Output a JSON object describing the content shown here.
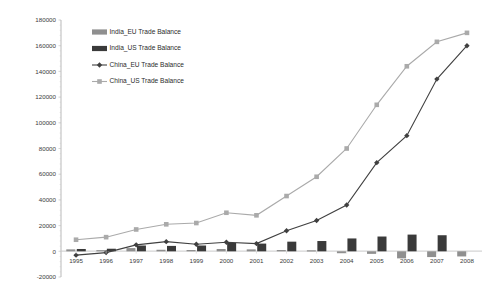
{
  "chart_data": {
    "type": "bar",
    "title": "",
    "xlabel": "",
    "ylabel": "",
    "grid": false,
    "legend_position": "top-left-inside",
    "categories": [
      "1995",
      "1996",
      "1997",
      "1998",
      "1999",
      "2000",
      "2001",
      "2002",
      "2003",
      "2004",
      "2005",
      "2006",
      "2007",
      "2008"
    ],
    "ylim": [
      -20000,
      180000
    ],
    "ytick_labels": [
      "180000",
      "160000",
      "140000",
      "120000",
      "100000",
      "80000",
      "60000",
      "40000",
      "20000",
      "0",
      "-20000"
    ],
    "ytick_values": [
      180000,
      160000,
      140000,
      120000,
      100000,
      80000,
      60000,
      40000,
      20000,
      0,
      -20000
    ],
    "series": [
      {
        "name": "India_EU Trade Balance",
        "kind": "bar",
        "color": "#8f8f8f",
        "values": [
          1500,
          900,
          2500,
          1200,
          1000,
          1800,
          1500,
          1000,
          800,
          -1500,
          -2000,
          -5500,
          -4500,
          -4000
        ]
      },
      {
        "name": "India_US Trade Balance",
        "kind": "bar",
        "color": "#3a3a3a",
        "values": [
          1800,
          2000,
          4500,
          4200,
          4500,
          6500,
          6000,
          7500,
          8000,
          10000,
          11500,
          13000,
          12500,
          0
        ]
      },
      {
        "name": "China_EU Trade Balance",
        "kind": "line",
        "color": "#404040",
        "marker": "diamond",
        "values": [
          -3000,
          -1000,
          5000,
          7500,
          5500,
          7000,
          6000,
          16000,
          24000,
          36000,
          69000,
          90000,
          134000,
          160000
        ]
      },
      {
        "name": "China_US Trade Balance",
        "kind": "line",
        "color": "#aaaaaa",
        "marker": "square",
        "values": [
          9000,
          11000,
          17000,
          21000,
          22000,
          30000,
          28000,
          43000,
          58000,
          80000,
          114000,
          144000,
          163000,
          170000
        ]
      }
    ]
  },
  "axis": {
    "axis_color": "#b9b9b9",
    "zero_line_color": "#c9c9c9",
    "tick_color": "#cccccc"
  }
}
